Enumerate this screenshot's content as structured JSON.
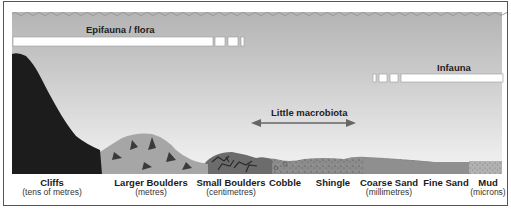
{
  "diagram": {
    "bands": {
      "epifauna": {
        "label": "Epifauna / flora"
      },
      "infauna": {
        "label": "Infauna"
      },
      "middle": {
        "label": "Little macrobiota"
      }
    },
    "substrates": [
      {
        "name": "Cliffs",
        "scale": "(tens of metres)"
      },
      {
        "name": "Larger Boulders",
        "scale": "(metres)"
      },
      {
        "name": "Small Boulders",
        "scale": "(centimetres)"
      },
      {
        "name": "Cobble",
        "scale": ""
      },
      {
        "name": "Shingle",
        "scale": ""
      },
      {
        "name": "Coarse Sand",
        "scale": "(millimetres)"
      },
      {
        "name": "Fine Sand",
        "scale": ""
      },
      {
        "name": "Mud",
        "scale": "(microns)"
      }
    ],
    "colors": {
      "sky_top": "#b8b8b8",
      "sky_bottom": "#f2f2f2",
      "cliff": "#1c1c1c",
      "boulder": "#a9a9a9",
      "boulder_crack": "#3a3a3a",
      "small_boulder": "#6e6e6e",
      "sediment": "#8a8a8a",
      "mud": "#b0b0b0"
    }
  }
}
